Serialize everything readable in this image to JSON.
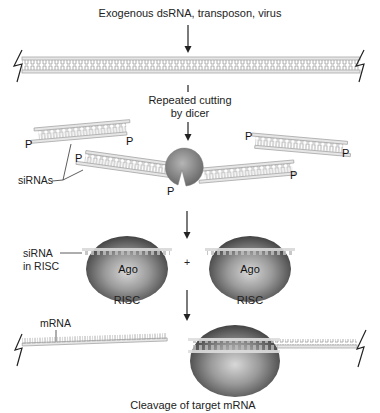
{
  "diagram": {
    "colors": {
      "background": "#ffffff",
      "rna_strand": "#e6e6e6",
      "rna_outline": "#a8a8a8",
      "protein_dark": "#3a3a3a",
      "protein_light": "#cfcfcf",
      "text": "#222222"
    },
    "steps": {
      "input_label": "Exogenous dsRNA, transposon, virus",
      "dicer_label_line1": "Repeated cutting",
      "dicer_label_line2": "by dicer",
      "final_label": "Cleavage of target mRNA"
    },
    "labels": {
      "sirnas": "siRNAs",
      "sirna_in_risc_line1": "siRNA",
      "sirna_in_risc_line2": "in RISC",
      "risc_left": "RISC",
      "risc_right": "RISC",
      "ago_left": "Ago",
      "ago_right": "Ago",
      "plus": "+",
      "mrna": "mRNA",
      "phosphate": "P"
    },
    "icons": {
      "dicer": "dicer-pacman-icon",
      "break": "zigzag-break-icon",
      "arrow": "down-arrow-icon"
    }
  }
}
